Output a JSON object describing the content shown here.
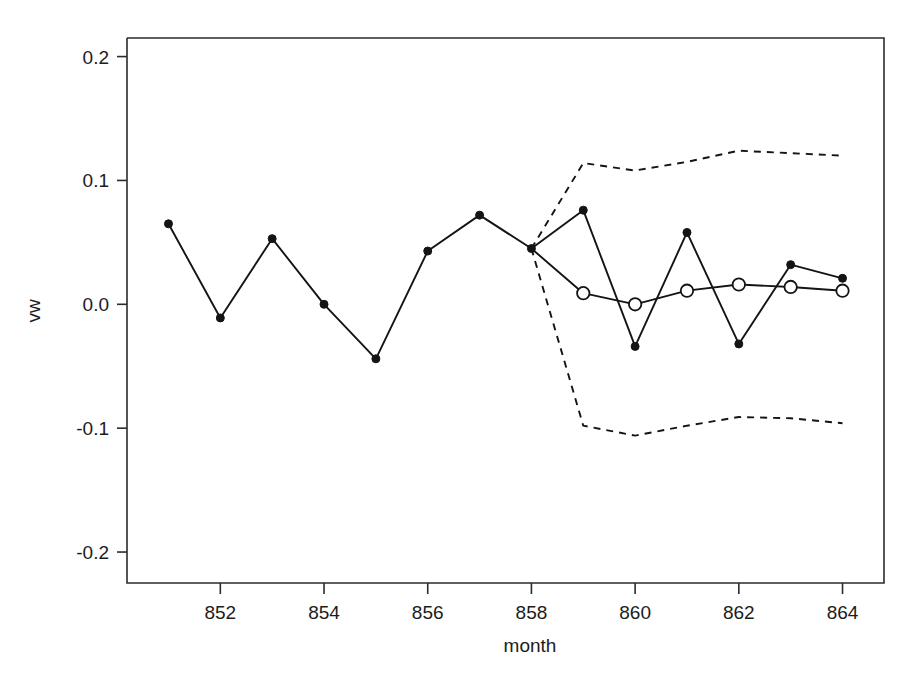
{
  "chart_data": {
    "type": "line",
    "title": "",
    "xlabel": "month",
    "ylabel": "vw",
    "xlim": [
      850.2,
      864.8
    ],
    "ylim": [
      -0.225,
      0.215
    ],
    "grid": false,
    "legend": "none",
    "x_ticks": [
      852,
      854,
      856,
      858,
      860,
      862,
      864
    ],
    "x_tick_labels": [
      "852",
      "854",
      "856",
      "858",
      "860",
      "862",
      "864"
    ],
    "y_ticks": [
      0.2,
      0.1,
      0.0,
      -0.1,
      -0.2
    ],
    "y_tick_labels": [
      "0.2",
      "0.1",
      "0.0",
      "-0.1",
      "-0.2"
    ],
    "series": [
      {
        "name": "observed",
        "style": "solid-filled-circles",
        "x": [
          851,
          852,
          853,
          854,
          855,
          856,
          857,
          858,
          859,
          860,
          861,
          862,
          863,
          864
        ],
        "values": [
          0.065,
          -0.011,
          0.053,
          0.0,
          -0.044,
          0.043,
          0.072,
          0.045,
          0.076,
          -0.034,
          0.058,
          -0.032,
          0.032,
          0.021
        ]
      },
      {
        "name": "forecast",
        "style": "solid-open-circles",
        "x": [
          858,
          859,
          860,
          861,
          862,
          863,
          864
        ],
        "values": [
          0.045,
          0.009,
          0.0,
          0.011,
          0.016,
          0.014,
          0.011
        ]
      },
      {
        "name": "upper-prediction-interval",
        "style": "dashed",
        "x": [
          858,
          859,
          860,
          861,
          862,
          863,
          864
        ],
        "values": [
          0.045,
          0.114,
          0.108,
          0.115,
          0.124,
          0.122,
          0.12
        ]
      },
      {
        "name": "lower-prediction-interval",
        "style": "dashed",
        "x": [
          858,
          859,
          860,
          861,
          862,
          863,
          864
        ],
        "values": [
          0.045,
          -0.098,
          -0.106,
          -0.098,
          -0.091,
          -0.092,
          -0.096
        ]
      }
    ]
  },
  "axis": {
    "x_title": "month",
    "y_title": "vw"
  },
  "colors": {
    "line": "#141414",
    "axis": "#2b2b2b",
    "background": "#ffffff"
  }
}
